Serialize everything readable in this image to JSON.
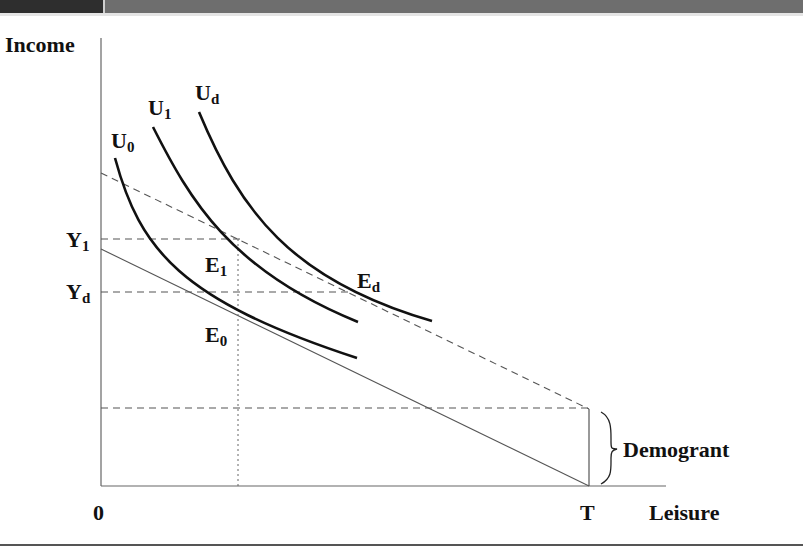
{
  "header": {
    "bar_colors": {
      "left": "#2e2e2e",
      "right": "#6e6e6e"
    }
  },
  "diagram": {
    "axes": {
      "y_label": "Income",
      "x_label": "Leisure",
      "origin_label": "0",
      "x_end_label": "T"
    },
    "y_ticks": {
      "y1": "Y",
      "y1_sub": "1",
      "yd": "Y",
      "yd_sub": "d"
    },
    "curves": {
      "u0": {
        "main": "U",
        "sub": "0"
      },
      "u1": {
        "main": "U",
        "sub": "1"
      },
      "ud": {
        "main": "U",
        "sub": "d"
      }
    },
    "points": {
      "e0": {
        "main": "E",
        "sub": "0"
      },
      "e1": {
        "main": "E",
        "sub": "1"
      },
      "ed": {
        "main": "E",
        "sub": "d"
      }
    },
    "annotation": "Demogrant",
    "lines": {
      "budget_original": "solid",
      "budget_with_demogrant": "dashed",
      "income_guides": "dashed",
      "leisure_guide": "dotted"
    }
  }
}
